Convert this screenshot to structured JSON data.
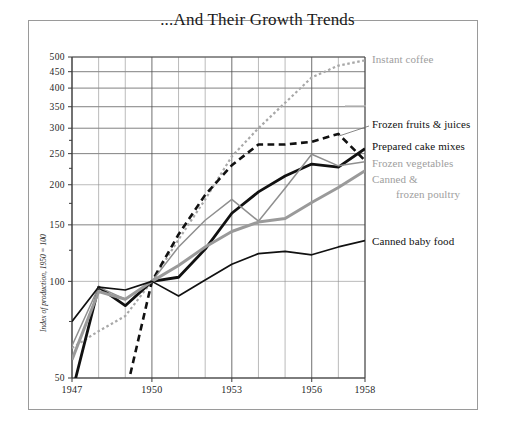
{
  "chart_data": {
    "type": "line",
    "title": "...And Their Growth Trends",
    "xlabel": "",
    "ylabel": "Index of production, 1950 = 100",
    "yscale": "log",
    "ylim": [
      50,
      500
    ],
    "xlim": [
      1947,
      1958
    ],
    "yticks": [
      50,
      100,
      150,
      200,
      250,
      300,
      350,
      400,
      450,
      500
    ],
    "ytick_labels": [
      "50",
      "100",
      "150",
      "200",
      "250",
      "300",
      "350",
      "400",
      "450",
      "500"
    ],
    "xticks": [
      1947,
      1950,
      1953,
      1956,
      1958
    ],
    "xtick_labels": [
      "1947",
      "1950",
      "1953",
      "1956",
      "1958"
    ],
    "x": [
      1947,
      1948,
      1949,
      1950,
      1951,
      1952,
      1953,
      1954,
      1955,
      1956,
      1957,
      1958
    ],
    "grid": true,
    "legend_position": "right-inline",
    "series": [
      {
        "name": "Instant coffee",
        "color": "#a8a8a8",
        "style": "dotted",
        "width": 2.2,
        "label_color": "#a0a0a0",
        "values": [
          62,
          70,
          78,
          100,
          135,
          180,
          245,
          300,
          360,
          432,
          470,
          488
        ]
      },
      {
        "name": "Frozen fruits & juices",
        "color": "#111111",
        "style": "dashed",
        "width": 2.6,
        "label_color": "#111111",
        "values": [
          null,
          null,
          44,
          100,
          140,
          186,
          230,
          267,
          267,
          272,
          288,
          238
        ]
      },
      {
        "name": "Prepared cake mixes",
        "color": "#111111",
        "style": "solid",
        "width": 2.8,
        "label_color": "#111111",
        "values": [
          45,
          96,
          84,
          100,
          103,
          126,
          163,
          190,
          213,
          232,
          227,
          259
        ]
      },
      {
        "name": "Frozen vegetables",
        "color": "#8f8f8f",
        "style": "solid",
        "width": 1.5,
        "label_color": "#9e9e9e",
        "values": [
          63,
          96,
          88,
          100,
          128,
          155,
          180,
          154,
          195,
          249,
          229,
          236
        ]
      },
      {
        "name": "Canned & frozen poultry",
        "name_line1": "Canned &",
        "name_line2": "frozen poultry",
        "color": "#9a9a9a",
        "style": "solid",
        "width": 3.0,
        "label_color": "#a5a5a5",
        "values": [
          57,
          93,
          88,
          100,
          112,
          128,
          143,
          153,
          157,
          176,
          196,
          221
        ]
      },
      {
        "name": "Canned baby food",
        "color": "#111111",
        "style": "solid",
        "width": 1.7,
        "label_color": "#111111",
        "values": [
          75,
          96,
          94,
          100,
          90,
          101,
          113,
          122,
          124,
          121,
          128,
          134
        ]
      }
    ]
  },
  "frame": {
    "border_color": "#9a9a9a"
  },
  "background": "#ffffff"
}
